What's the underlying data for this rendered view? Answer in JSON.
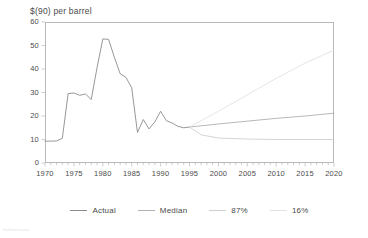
{
  "chart_data": {
    "type": "line",
    "title": "$(90) per barrel",
    "xlabel": "",
    "ylabel": "",
    "xlim": [
      1970,
      2020
    ],
    "ylim": [
      0,
      60
    ],
    "ytick_labels": [
      "0",
      "10",
      "20",
      "30",
      "40",
      "50",
      "60"
    ],
    "ytick_values": [
      0,
      10,
      20,
      30,
      40,
      50,
      60
    ],
    "xtick_labels": [
      "1970",
      "1975",
      "1980",
      "1985",
      "1990",
      "1995",
      "2000",
      "2005",
      "2010",
      "2015",
      "2020"
    ],
    "xtick_values": [
      1970,
      1975,
      1980,
      1985,
      1990,
      1995,
      2000,
      2005,
      2010,
      2015,
      2020
    ],
    "minor_xticks_interval": 1,
    "grid": false,
    "legend_position": "bottom-center",
    "series": [
      {
        "name": "Actual",
        "color": "#8c8c8c",
        "x": [
          1970,
          1971,
          1972,
          1973,
          1974,
          1975,
          1976,
          1977,
          1978,
          1979,
          1980,
          1981,
          1982,
          1983,
          1984,
          1985,
          1986,
          1987,
          1988,
          1989,
          1990,
          1991,
          1992,
          1993,
          1994,
          1995
        ],
        "values": [
          9.3,
          9.3,
          9.4,
          10.5,
          29.5,
          29.8,
          28.8,
          29.4,
          27.0,
          40.5,
          52.8,
          52.6,
          45.0,
          38.0,
          36.5,
          32.0,
          13.0,
          18.5,
          14.5,
          17.5,
          22.0,
          18.0,
          17.0,
          15.6,
          15.0,
          15.3
        ]
      },
      {
        "name": "Median",
        "color": "#b0b0b0",
        "x": [
          1995,
          2000,
          2005,
          2010,
          2015,
          2020
        ],
        "values": [
          15.3,
          16.6,
          17.8,
          19.0,
          20.0,
          21.2
        ]
      },
      {
        "name": "87%",
        "color": "#cfcfcf",
        "x": [
          1995,
          1997,
          2000,
          2005,
          2010,
          2015,
          2020
        ],
        "values": [
          15.3,
          12.0,
          10.6,
          10.2,
          10.0,
          10.0,
          10.0
        ]
      },
      {
        "name": "16%",
        "color": "#e2e2e2",
        "x": [
          1995,
          2000,
          2005,
          2010,
          2015,
          2020
        ],
        "values": [
          15.3,
          22.0,
          29.0,
          36.0,
          42.5,
          48.0
        ]
      }
    ],
    "legend": [
      {
        "label": "Actual",
        "color": "#8c8c8c"
      },
      {
        "label": "Median",
        "color": "#b0b0b0"
      },
      {
        "label": "87%",
        "color": "#cfcfcf"
      },
      {
        "label": "16%",
        "color": "#e2e2e2"
      }
    ],
    "watermark": "illegible-watermark"
  },
  "colors": {
    "axis": "#b9b9b9",
    "text": "#4a4a4a",
    "background": "#ffffff"
  }
}
